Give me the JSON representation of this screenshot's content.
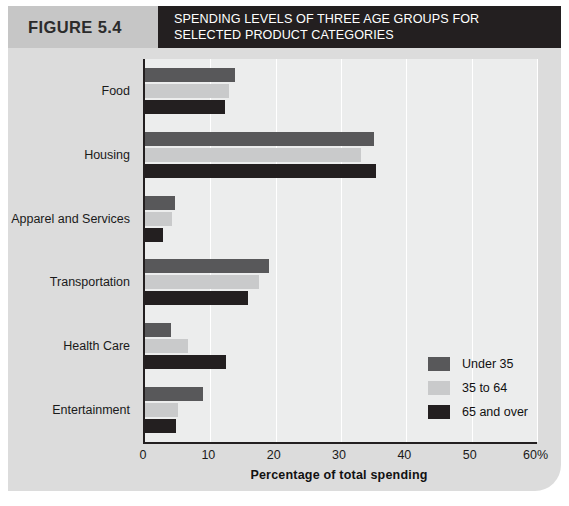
{
  "figure": {
    "number_label": "FIGURE 5.4",
    "title": "SPENDING LEVELS OF THREE AGE GROUPS FOR SELECTED PRODUCT CATEGORIES"
  },
  "colors": {
    "series_under_35": "#58585a",
    "series_35_to_64": "#c9cacb",
    "series_65_and_over": "#231f20",
    "header_band": "#231f20",
    "figure_number_band": "#c6c6c6",
    "page_background": "#dcdcdc",
    "plot_background": "#eceded"
  },
  "legend": {
    "position": "inside-bottom-right",
    "entries": [
      {
        "label": "Under 35",
        "color": "#58585a"
      },
      {
        "label": "35 to 64",
        "color": "#c9cacb"
      },
      {
        "label": "65 and over",
        "color": "#231f20"
      }
    ]
  },
  "chart_data": {
    "type": "bar",
    "orientation": "horizontal",
    "title": "SPENDING LEVELS OF THREE AGE GROUPS FOR SELECTED PRODUCT CATEGORIES",
    "xlabel": "Percentage of total spending",
    "ylabel": "",
    "xlim": [
      0,
      60
    ],
    "xticks": [
      0,
      10,
      20,
      30,
      40,
      50,
      60
    ],
    "xticklabels": [
      "0",
      "10",
      "20",
      "30",
      "40",
      "50",
      "60%"
    ],
    "grid": "vertical",
    "categories": [
      "Food",
      "Housing",
      "Apparel and Services",
      "Transportation",
      "Health Care",
      "Entertainment"
    ],
    "series": [
      {
        "name": "Under 35",
        "color": "#58585a",
        "values": [
          13.8,
          35.0,
          4.6,
          19.0,
          4.0,
          8.9
        ]
      },
      {
        "name": "35 to 64",
        "color": "#c9cacb",
        "values": [
          12.8,
          33.0,
          4.1,
          17.5,
          6.6,
          5.1
        ]
      },
      {
        "name": "65 and over",
        "color": "#231f20",
        "values": [
          12.3,
          35.4,
          2.7,
          15.8,
          12.4,
          4.8
        ]
      }
    ]
  }
}
